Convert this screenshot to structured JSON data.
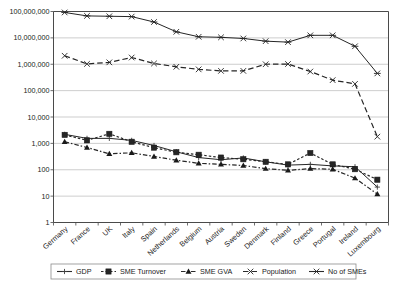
{
  "chart_data": {
    "type": "line",
    "title": "",
    "xlabel": "",
    "ylabel": "",
    "yscale": "log",
    "ylim": [
      1,
      100000000
    ],
    "grid": true,
    "legend_position": "bottom",
    "ytick_labels": [
      "1",
      "10",
      "100",
      "1,000",
      "10,000",
      "100,000",
      "1,000,000",
      "10,000,000",
      "100,000,000"
    ],
    "ytick_values": [
      1,
      10,
      100,
      1000,
      10000,
      100000,
      1000000,
      10000000,
      100000000
    ],
    "categories": [
      "Germany",
      "France",
      "UK",
      "Italy",
      "Spain",
      "Netherlands",
      "Belgium",
      "Austria",
      "Sweden",
      "Denmark",
      "Finland",
      "Greece",
      "Portugal",
      "Ireland",
      "Luxembourg"
    ],
    "series": [
      {
        "name": "GDP",
        "marker": "plus-line",
        "linestyle": "solid",
        "values": [
          2200,
          1550,
          1550,
          1300,
          830,
          480,
          290,
          240,
          280,
          200,
          150,
          160,
          140,
          130,
          22
        ]
      },
      {
        "name": "SME Turnover",
        "marker": "square",
        "linestyle": "dotted",
        "values": [
          2100,
          1300,
          2300,
          1150,
          690,
          460,
          370,
          290,
          250,
          200,
          160,
          430,
          160,
          105,
          42
        ]
      },
      {
        "name": "SME GVA",
        "marker": "triangle",
        "linestyle": "dashed-dot",
        "values": [
          1150,
          700,
          400,
          440,
          320,
          230,
          175,
          160,
          145,
          110,
          95,
          110,
          105,
          48,
          12
        ]
      },
      {
        "name": "Population",
        "marker": "x-dash",
        "linestyle": "dashed",
        "values": [
          2100000,
          1030000,
          1180000,
          1800000,
          1070000,
          800000,
          640000,
          560000,
          560000,
          1000000,
          1020000,
          530000,
          250000,
          180000,
          1800
        ]
      },
      {
        "name": "No of SMEs",
        "marker": "star-cross",
        "linestyle": "solid",
        "values": [
          92000000,
          68000000,
          66000000,
          64000000,
          40000000,
          17000000,
          11000000,
          10500000,
          9500000,
          7500000,
          6900000,
          12500000,
          12500000,
          4800000,
          450000
        ]
      }
    ]
  },
  "legend": {
    "entries": [
      {
        "label": "GDP",
        "marker_name": "gdp-marker"
      },
      {
        "label": "SME Turnover",
        "marker_name": "sme-turnover-marker"
      },
      {
        "label": "SME GVA",
        "marker_name": "sme-gva-marker"
      },
      {
        "label": "Population",
        "marker_name": "population-marker"
      },
      {
        "label": "No of SMEs",
        "marker_name": "no-of-smes-marker"
      }
    ]
  }
}
